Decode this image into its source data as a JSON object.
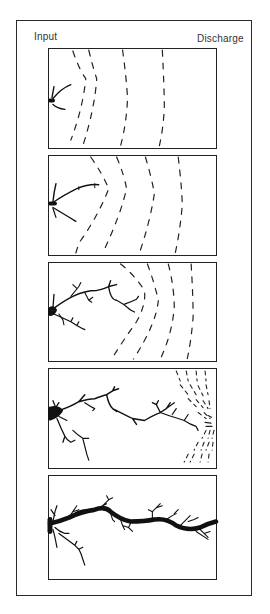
{
  "figure": {
    "labels": {
      "input": "Input",
      "discharge": "Discharge"
    },
    "panels": [
      {
        "stage": 1,
        "description": "Small initial channel network at input; four dashed equipotential lines spread across panel"
      },
      {
        "stage": 2,
        "description": "Channel extends further; dashed equipotential lines curve around channel tip"
      },
      {
        "stage": 3,
        "description": "Branching channel network reaches mid-panel; equipotential lines compressed ahead of tip"
      },
      {
        "stage": 4,
        "description": "Dendritic channel nearly reaches discharge; dense dashed lines converge at discharge"
      },
      {
        "stage": 5,
        "description": "Channel connects input to discharge forming a thick continuous conduit with side branches"
      }
    ],
    "colors": {
      "ink": "#1a1a1a",
      "background": "#ffffff"
    }
  }
}
